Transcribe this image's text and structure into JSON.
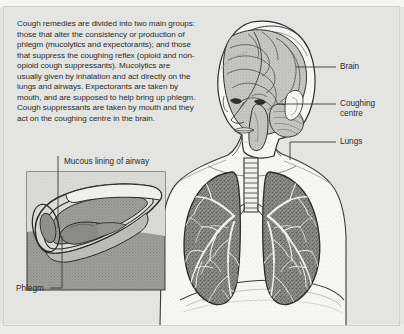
{
  "figure": {
    "caption": "Cough remedies are divided into two main groups: those that alter the consistency or production of phlegm (mucolytics and expectorants); and those that suppress the coughing reflex (opioid and non-opioid cough suppressants). Mucolytics are usually given by inhalation and act directly on the lungs and airways. Expectorants are taken by mouth, and are supposed to help bring up phlegm. Cough suppressants are taken by mouth and they act on the coughing centre in the brain.",
    "background_color": "#e4e4e2",
    "line_color": "#2b2b2b"
  },
  "labels": {
    "brain": "Brain",
    "coughing_centre": "Coughing\ncentre",
    "lungs": "Lungs",
    "mucous_lining": "Mucous lining of airway",
    "phlegm": "Phlegm"
  },
  "anatomy": {
    "head": "three-quarter view human head with cutaway brain",
    "brain_regions": [
      "cerebrum",
      "cerebellum",
      "brainstem"
    ],
    "torso": "upper torso with shoulders, neck and diaphragm",
    "lungs": "pair of lungs with branching bronchial tree",
    "trachea": "ringed windpipe dividing into two main bronchi",
    "inset": "magnified cutaway of an airway showing mucous lining and phlegm"
  },
  "colors": {
    "lung_fill": "#8d8d8a",
    "brain_fill": "#c9c9c6",
    "skin_fill": "#f7f7f6",
    "inset_fill": "#a9a9a6",
    "inset_border": "#3a3a3a"
  }
}
